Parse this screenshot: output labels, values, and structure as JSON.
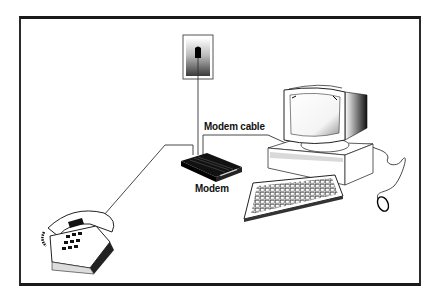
{
  "diagram": {
    "labels": {
      "modem_cable": "Modem cable",
      "modem": "Modem"
    },
    "components": [
      {
        "id": "wall-jack",
        "name": "Telephone wall jack"
      },
      {
        "id": "modem",
        "name": "Modem"
      },
      {
        "id": "computer",
        "name": "Desktop computer with monitor"
      },
      {
        "id": "keyboard",
        "name": "Keyboard"
      },
      {
        "id": "mouse",
        "name": "Mouse"
      },
      {
        "id": "telephone",
        "name": "Telephone"
      }
    ],
    "connections": [
      {
        "from": "wall-jack",
        "to": "modem"
      },
      {
        "from": "modem",
        "to": "computer",
        "label": "Modem cable"
      },
      {
        "from": "modem",
        "to": "telephone"
      }
    ],
    "colors": {
      "frame": "#1a1a1a",
      "line": "#333333",
      "background": "#ffffff"
    }
  }
}
